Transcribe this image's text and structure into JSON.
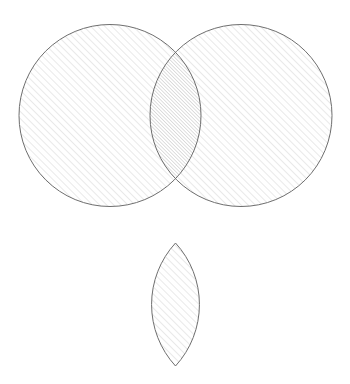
{
  "figure": {
    "canvas": {
      "width": 350,
      "height": 384,
      "background_color": "#ffffff"
    },
    "style": {
      "stroke_color": "#6e6e6e",
      "stroke_width": 1,
      "hatch_color": "#d8d8d8",
      "hatch_color_overlap": "#c2c2c2",
      "hatch_angle_deg": 45,
      "hatch_direction": "forward-slash",
      "hatch_spacing_px": 5,
      "hatch_spacing_overlap_px": 2.5,
      "fill_color": "#ffffff"
    },
    "shapes": [
      {
        "id": "left-circle",
        "type": "circle",
        "label": "A",
        "cx": 110,
        "cy": 115.5,
        "r": 91,
        "fill": "hatched-single"
      },
      {
        "id": "right-circle",
        "type": "circle",
        "label": "B",
        "cx": 241,
        "cy": 115.5,
        "r": 91,
        "fill": "hatched-single"
      },
      {
        "id": "overlap-lens",
        "type": "lens",
        "label": "A ∩ B",
        "cx": 175.5,
        "top_y": 52,
        "bottom_y": 179,
        "half_width": 25.5,
        "fill": "hatched-double"
      },
      {
        "id": "result-lens",
        "type": "lens",
        "label": "Intersection result",
        "cx": 175.5,
        "top_y": 243,
        "bottom_y": 366,
        "half_width": 25.5,
        "fill": "hatched-single"
      }
    ],
    "intersection_points": [
      {
        "x": 175.5,
        "y": 52
      },
      {
        "x": 175.5,
        "y": 179
      }
    ]
  }
}
